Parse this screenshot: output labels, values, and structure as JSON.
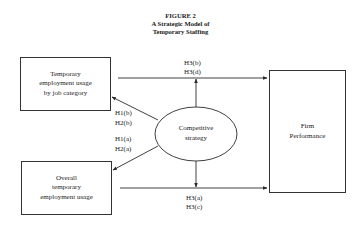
{
  "figure": {
    "number": "FIGURE 2",
    "title_line1": "A Strategic Model of",
    "title_line2": "Temporary Staffing"
  },
  "nodes": {
    "job_category": {
      "line1": "Temporary",
      "line2": "employment usage",
      "line3": "by job category"
    },
    "overall": {
      "line1": "Overall",
      "line2": "temporary",
      "line3": "employment usage"
    },
    "strategy": {
      "line1": "Competitive",
      "line2": "strategy"
    },
    "performance": {
      "line1": "Firm",
      "line2": "Performance"
    }
  },
  "hypotheses": {
    "upper_left": [
      "H1(b)",
      "H2(b)"
    ],
    "lower_left": [
      "H1(a)",
      "H2(a)"
    ],
    "top": [
      "H3(b)",
      "H3(d)"
    ],
    "bottom": [
      "H3(a)",
      "H3(c)"
    ]
  },
  "colors": {
    "line": "#2a2a2a",
    "text": "#1a1a1a",
    "background": "#ffffff"
  }
}
